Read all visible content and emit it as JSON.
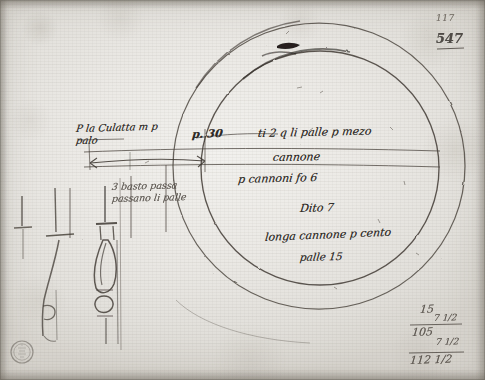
{
  "document": {
    "kind": "manuscript-folio",
    "description": "Ink drawing of two concentric circles with cannon profile sketches and measurement annotations",
    "paper_color": "#eae8e4",
    "ink_color": "#2e2a26"
  },
  "folio_marks": {
    "page_number": "117",
    "catalog_number": "547"
  },
  "annotations": {
    "left_upper_line1": "P la Culatta m p",
    "left_upper_line2": "palo",
    "dimension_label": "p. 30",
    "left_lower_line1": "3 basto passa",
    "left_lower_line2": "passano li palle",
    "right_line1": "ti 2 q li palle p mezo",
    "right_line2": "cannone",
    "right_line3": "p cannoni fo 6",
    "right_line4": "Dito 7",
    "right_line5": "longa cannone p cento",
    "right_line6": "palle 15"
  },
  "calculation": {
    "operand_1": "15",
    "operand_2": "7 1/2",
    "subtotal": "105",
    "addend": "7 1/2",
    "total": "112 1/2"
  },
  "figures": {
    "outer_circle": "outer-circle",
    "inner_circle": "inner-circle",
    "ramrod": "ramrod-sketch",
    "cannon_left": "cannon-profile-left",
    "cannon_right": "cannon-profile-right",
    "collection_stamp": "collection-stamp"
  }
}
